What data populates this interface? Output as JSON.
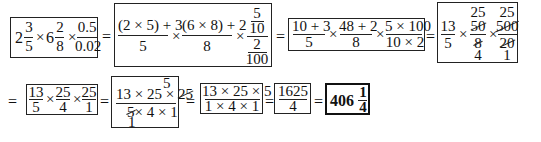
{
  "expression": {
    "row1": {
      "box1": {
        "whole1": "2",
        "num1": "3",
        "den1": "5",
        "times1": "×",
        "whole2": "6",
        "num2": "2",
        "den2": "8",
        "times2": "×",
        "num3": "0.5",
        "den3": "0.02"
      },
      "eq1": "=",
      "box2": {
        "num1": "(2 × 5) + 3",
        "den1": "5",
        "times1": "×",
        "num2": "(6 × 8) + 2",
        "den2": "8",
        "times2": "×",
        "inner_num_num": "5",
        "inner_num_den": "10",
        "inner_den_num": "2",
        "inner_den_den": "100"
      },
      "eq2": "=",
      "box3": {
        "num1": "10 + 3",
        "den1": "5",
        "times1": "×",
        "num2": "48 + 2",
        "den2": "8",
        "times2": "×",
        "num3": "5 × 100",
        "den3": "10 × 2"
      },
      "eq3": "=",
      "box4": {
        "num1": "13",
        "den1": "5",
        "times1": "×",
        "cancel_above2": "25",
        "num2": "50",
        "den2": "8",
        "cancel_below2": "4",
        "times2": "×",
        "cancel_above3": "25",
        "num3": "500",
        "den3": "20",
        "cancel_below3": "1"
      }
    },
    "row2": {
      "eq0": "=",
      "box5": {
        "num1": "13",
        "den1": "5",
        "times1": "×",
        "num2": "25",
        "den2": "4",
        "times2": "×",
        "num3": "25",
        "den3": "1"
      },
      "eq1": "=",
      "box6": {
        "cancel_above": "5",
        "num_a": "13 × 25 × ",
        "num_b": "25",
        "den_a": "5",
        "den_b": "× 4 × 1",
        "cancel_below": "1"
      },
      "eq2": "=",
      "box7": {
        "num": "13 × 25 × 5",
        "den": "1 × 4 × 1"
      },
      "eq3": "=",
      "box8": {
        "num": "1625",
        "den": "4"
      },
      "eq4": "=",
      "box9": {
        "whole": "406",
        "num": "1",
        "den": "4"
      }
    }
  }
}
